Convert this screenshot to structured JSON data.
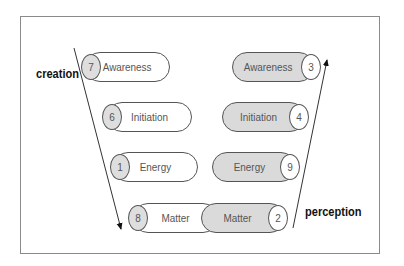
{
  "labels": {
    "left": "creation",
    "right": "perception"
  },
  "left_column": [
    {
      "number": "7",
      "label": "Awareness"
    },
    {
      "number": "6",
      "label": "Initiation"
    },
    {
      "number": "1",
      "label": "Energy"
    },
    {
      "number": "8",
      "label": "Matter"
    }
  ],
  "right_column": [
    {
      "number": "3",
      "label": "Awareness"
    },
    {
      "number": "4",
      "label": "Initiation"
    },
    {
      "number": "9",
      "label": "Energy"
    },
    {
      "number": "2",
      "label": "Matter"
    }
  ],
  "colors": {
    "gray_fill": "#dadada",
    "stroke": "#555555",
    "frame": "#8a8a8a"
  }
}
